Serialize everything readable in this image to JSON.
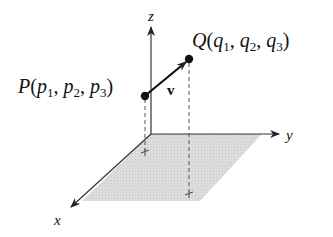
{
  "diagram": {
    "type": "3d-vector",
    "axes": {
      "x": {
        "label": "x"
      },
      "y": {
        "label": "y"
      },
      "z": {
        "label": "z"
      }
    },
    "points": {
      "P": {
        "name": "P",
        "coords": [
          "p",
          "p",
          "p"
        ],
        "subscripts": [
          "1",
          "2",
          "3"
        ]
      },
      "Q": {
        "name": "Q",
        "coords": [
          "q",
          "q",
          "q"
        ],
        "subscripts": [
          "1",
          "2",
          "3"
        ]
      }
    },
    "vector": {
      "label": "v"
    },
    "colors": {
      "axis": "#333333",
      "plane": "#d9d9d9",
      "dashed": "#555555",
      "point": "#111111"
    }
  }
}
